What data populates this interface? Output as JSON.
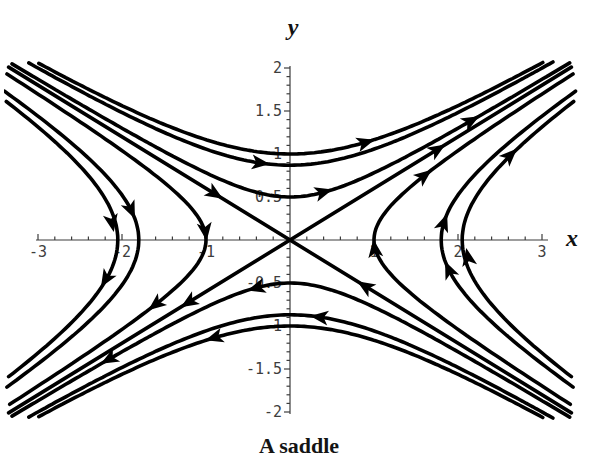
{
  "chart_data": {
    "type": "line",
    "subtype": "phase-portrait-saddle",
    "title": "A saddle",
    "xlabel": "x",
    "ylabel": "y",
    "xlim": [
      -3,
      3
    ],
    "ylim": [
      -2,
      2
    ],
    "grid": false,
    "legend": "none",
    "background_color": "#ffffff",
    "axis_color": "#3d3d3d",
    "curve_color": "#000000",
    "curve_width": 3.6,
    "x_tick_labels": [
      "-3",
      "-2",
      "-1",
      "1",
      "2",
      "3"
    ],
    "x_tick_values": [
      -3,
      -2,
      -1,
      1,
      2,
      3
    ],
    "x_minor_tick_step": 0.2,
    "y_tick_labels": [
      "-2",
      "-1.5",
      "-1",
      "-0.5",
      "0.5",
      "1",
      "1.5",
      "2"
    ],
    "y_tick_values": [
      -2,
      -1.5,
      -1,
      -0.5,
      0.5,
      1,
      1.5,
      2
    ],
    "y_minor_tick_step": 0.1,
    "separatrix_slope": 0.6,
    "series": [
      {
        "name": "unstable-separatrix",
        "equation": "y = 0.6x",
        "flow": "outward from origin"
      },
      {
        "name": "stable-separatrix",
        "equation": "y = -0.6x",
        "flow": "inward toward origin"
      },
      {
        "name": "upper-hyperbolas",
        "equation": "y = sqrt((0.6x)^2 + b^2)",
        "b_values": [
          0.5,
          0.87,
          1.0
        ],
        "flow": "rightward"
      },
      {
        "name": "lower-hyperbolas",
        "equation": "y = -sqrt((0.6x)^2 + b^2)",
        "b_values": [
          0.5,
          0.87,
          1.0
        ],
        "flow": "leftward"
      },
      {
        "name": "right-hyperbolas",
        "equation": "x = sqrt((y/0.6)^2 + a^2)",
        "a_values": [
          1.0,
          1.8,
          2.05
        ],
        "flow": "upward"
      },
      {
        "name": "left-hyperbolas",
        "equation": "x = -sqrt((y/0.6)^2 + a^2)",
        "a_values": [
          1.0,
          1.8,
          2.05
        ],
        "flow": "downward"
      }
    ],
    "arrows": [
      {
        "family": "upper-hyperbola-b0.5",
        "x": 0.45,
        "y": 0.57,
        "angle": -16
      },
      {
        "family": "upper-hyperbola-b0.5",
        "x": 2.2,
        "y": 1.41,
        "angle": -29
      },
      {
        "family": "upper-hyperbola-b0.87",
        "x": -0.3,
        "y": 0.89,
        "angle": 7
      },
      {
        "family": "upper-hyperbola-b1.0",
        "x": 0.95,
        "y": 1.15,
        "angle": -17
      },
      {
        "family": "lower-hyperbola-b0.5",
        "x": -0.45,
        "y": -0.57,
        "angle": 164
      },
      {
        "family": "lower-hyperbola-b0.5",
        "x": -2.2,
        "y": -1.41,
        "angle": 151
      },
      {
        "family": "lower-hyperbola-b0.87",
        "x": 0.3,
        "y": -0.89,
        "angle": 187
      },
      {
        "family": "lower-hyperbola-b1.0",
        "x": -0.95,
        "y": -1.15,
        "angle": 163
      },
      {
        "family": "right-hyperbola-a1.0",
        "x": 1.0,
        "y": -0.05,
        "angle": -98
      },
      {
        "family": "right-hyperbola-a1.0",
        "x": 1.64,
        "y": 0.78,
        "angle": -38
      },
      {
        "family": "right-hyperbola-a1.8",
        "x": 1.87,
        "y": -0.3,
        "angle": -114
      },
      {
        "family": "right-hyperbola-a1.8",
        "x": 1.85,
        "y": 0.25,
        "angle": -70
      },
      {
        "family": "right-hyperbola-a2.05",
        "x": 2.11,
        "y": -0.15,
        "angle": -101
      },
      {
        "family": "right-hyperbola-a2.05",
        "x": 2.66,
        "y": 1.02,
        "angle": -44
      },
      {
        "family": "left-hyperbola-a1.0",
        "x": -1.0,
        "y": 0.05,
        "angle": 82
      },
      {
        "family": "left-hyperbola-a1.0",
        "x": -1.64,
        "y": -0.78,
        "angle": 142
      },
      {
        "family": "left-hyperbola-a1.8",
        "x": -1.87,
        "y": 0.3,
        "angle": 66
      },
      {
        "family": "left-hyperbola-a2.05",
        "x": -2.11,
        "y": 0.15,
        "angle": 79
      },
      {
        "family": "left-hyperbola-a2.05",
        "x": -2.22,
        "y": -0.5,
        "angle": 121
      },
      {
        "family": "unstable-separatrix",
        "x": 1.8,
        "y": 1.08,
        "angle": -32
      },
      {
        "family": "unstable-separatrix",
        "x": -1.25,
        "y": -0.75,
        "angle": 148
      },
      {
        "family": "stable-separatrix",
        "x": -0.85,
        "y": 0.51,
        "angle": 32
      },
      {
        "family": "stable-separatrix",
        "x": 0.85,
        "y": -0.51,
        "angle": -148
      }
    ]
  }
}
